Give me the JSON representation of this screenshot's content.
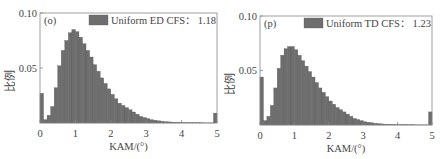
{
  "chart_data": [
    {
      "type": "bar",
      "panel_label": "(o)",
      "legend": "Uniform ED CFS： 1.18",
      "legend_name": "Uniform ED CFS",
      "legend_value": "1.18",
      "xlabel": "KAM/(°)",
      "ylabel": "比例",
      "xlim": [
        0,
        5
      ],
      "ylim": [
        0,
        0.1
      ],
      "xticks": [
        "0",
        "1",
        "2",
        "3",
        "4",
        "5"
      ],
      "yticks": [
        "0.05",
        "0.10"
      ],
      "bin_width": 0.1,
      "bar_color": "#6e6e6e",
      "values": [
        0.027,
        0.003,
        0.007,
        0.015,
        0.032,
        0.052,
        0.066,
        0.075,
        0.082,
        0.085,
        0.083,
        0.078,
        0.072,
        0.066,
        0.06,
        0.053,
        0.047,
        0.041,
        0.036,
        0.031,
        0.026,
        0.022,
        0.018,
        0.016,
        0.014,
        0.012,
        0.01,
        0.008,
        0.006,
        0.005,
        0.004,
        0.003,
        0.0025,
        0.002,
        0.0015,
        0.0012,
        0.001,
        0.0008,
        0.0006,
        0.0005,
        0.0004,
        0.0003,
        0.0003,
        0.0002,
        0.0002,
        0.0002,
        0.0001,
        0.0001,
        0.0001,
        0.009
      ]
    },
    {
      "type": "bar",
      "panel_label": "(p)",
      "legend": "Uniform TD CFS： 1.23",
      "legend_name": "Uniform TD CFS",
      "legend_value": "1.23",
      "xlabel": "KAM/(°)",
      "ylabel": "比例",
      "xlim": [
        0,
        5
      ],
      "ylim": [
        0,
        0.1
      ],
      "xticks": [
        "0",
        "1",
        "2",
        "3",
        "4",
        "5"
      ],
      "yticks": [
        "0.05",
        "0.10"
      ],
      "bin_width": 0.1,
      "bar_color": "#6e6e6e",
      "values": [
        0.044,
        0.004,
        0.008,
        0.018,
        0.034,
        0.052,
        0.064,
        0.07,
        0.072,
        0.072,
        0.069,
        0.064,
        0.059,
        0.054,
        0.049,
        0.044,
        0.039,
        0.034,
        0.03,
        0.026,
        0.022,
        0.019,
        0.016,
        0.014,
        0.012,
        0.01,
        0.008,
        0.006,
        0.005,
        0.004,
        0.003,
        0.0025,
        0.002,
        0.0015,
        0.0012,
        0.001,
        0.0008,
        0.0006,
        0.0005,
        0.0004,
        0.0003,
        0.0003,
        0.0002,
        0.0002,
        0.0002,
        0.0001,
        0.0001,
        0.0001,
        0.0001,
        0.012
      ]
    }
  ]
}
